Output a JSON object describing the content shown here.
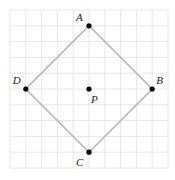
{
  "diagram": {
    "type": "geometry-grid",
    "grid": {
      "columns": 10,
      "rows": 10
    },
    "shape": "square",
    "vertices_order": [
      "A",
      "B",
      "C",
      "D"
    ],
    "points": [
      {
        "id": "A",
        "label": "A",
        "grid": [
          5,
          1
        ],
        "label_pos": "upper-left"
      },
      {
        "id": "B",
        "label": "B",
        "grid": [
          9,
          5
        ],
        "label_pos": "upper-right"
      },
      {
        "id": "C",
        "label": "C",
        "grid": [
          5,
          9
        ],
        "label_pos": "lower-left"
      },
      {
        "id": "D",
        "label": "D",
        "grid": [
          1,
          5
        ],
        "label_pos": "upper-left"
      },
      {
        "id": "P",
        "label": "P",
        "grid": [
          5,
          5
        ],
        "label_pos": "lower-right"
      }
    ]
  }
}
